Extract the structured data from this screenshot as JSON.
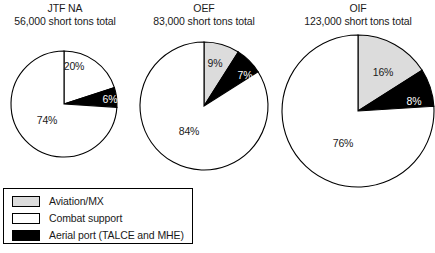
{
  "legend": {
    "items": [
      {
        "label": "Aviation/MX",
        "color": "#dcdcdc",
        "key": "aviation"
      },
      {
        "label": "Combat support",
        "color": "#ffffff",
        "key": "combat"
      },
      {
        "label": "Aerial port (TALCE and MHE)",
        "color": "#000000",
        "key": "aerial"
      }
    ]
  },
  "chart_data": [
    {
      "type": "pie",
      "title": "JTF NA",
      "subtitle": "56,000 short tons total",
      "categories": [
        "Aviation/MX",
        "Aerial port (TALCE and MHE)",
        "Combat support"
      ],
      "values": [
        20,
        6,
        74
      ],
      "labels": [
        "20%",
        "6%",
        "74%"
      ],
      "colors": [
        "#ffffff",
        "#000000",
        "#ffffff"
      ],
      "label_colors": [
        "dark",
        "light",
        "dark"
      ]
    },
    {
      "type": "pie",
      "title": "OEF",
      "subtitle": "83,000 short tons total",
      "categories": [
        "Aviation/MX",
        "Aerial port (TALCE and MHE)",
        "Combat support"
      ],
      "values": [
        9,
        7,
        84
      ],
      "labels": [
        "9%",
        "7%",
        "84%"
      ],
      "colors": [
        "#dcdcdc",
        "#000000",
        "#ffffff"
      ],
      "label_colors": [
        "dark",
        "light",
        "dark"
      ]
    },
    {
      "type": "pie",
      "title": "OIF",
      "subtitle": "123,000 short tons total",
      "categories": [
        "Aviation/MX",
        "Aerial port (TALCE and MHE)",
        "Combat support"
      ],
      "values": [
        16,
        8,
        76
      ],
      "labels": [
        "16%",
        "8%",
        "76%"
      ],
      "colors": [
        "#dcdcdc",
        "#000000",
        "#ffffff"
      ],
      "label_colors": [
        "dark",
        "light",
        "dark"
      ]
    }
  ],
  "geometry": [
    {
      "cx": 64,
      "cy": 104,
      "r": 53,
      "title_left": 0,
      "title_width": 130,
      "title_top": 2
    },
    {
      "cx": 204,
      "cy": 106,
      "r": 64,
      "title_left": 139,
      "title_width": 130,
      "title_top": 2
    },
    {
      "cx": 358,
      "cy": 111,
      "r": 76,
      "title_left": 293,
      "title_width": 130,
      "title_top": 2
    }
  ],
  "label_offsets": [
    [
      {
        "x": 74,
        "y": 66
      },
      {
        "x": 110,
        "y": 99
      },
      {
        "x": 47,
        "y": 120
      }
    ],
    [
      {
        "x": 215,
        "y": 63
      },
      {
        "x": 245,
        "y": 75
      },
      {
        "x": 189,
        "y": 131
      }
    ],
    [
      {
        "x": 383,
        "y": 72
      },
      {
        "x": 414,
        "y": 101
      },
      {
        "x": 343,
        "y": 143
      }
    ]
  ]
}
